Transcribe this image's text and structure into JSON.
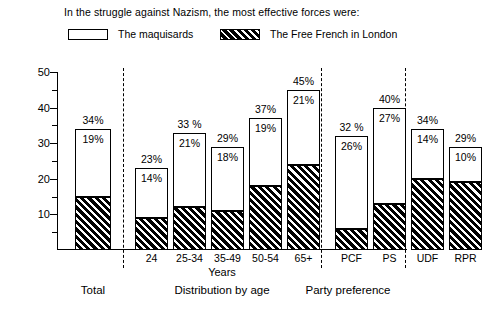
{
  "title": "In the struggle against Nazism, the most effective forces were:",
  "legend": [
    {
      "label": "The maquisards",
      "pattern": "white"
    },
    {
      "label": "The Free French in London",
      "pattern": "hatched"
    }
  ],
  "axes": {
    "ylabel": "Percent",
    "yticks": [
      "10",
      "20",
      "30",
      "40",
      "50"
    ],
    "ymin": 0,
    "ymax": 50,
    "xlabel_age": "Years"
  },
  "groups": [
    {
      "name": "Total",
      "title": "Total",
      "subtitle": ""
    },
    {
      "name": "age",
      "title": "Distribution by age",
      "subtitle": "Years"
    },
    {
      "name": "party",
      "title": "Party preference",
      "subtitle": ""
    }
  ],
  "chart_data": {
    "type": "bar",
    "title": "In the struggle against Nazism, the most effective forces were:",
    "xlabel": "",
    "ylabel": "Percent",
    "ylim": [
      0,
      50
    ],
    "grid": false,
    "legend_position": "top",
    "stacked": true,
    "groups": [
      "Total",
      "Distribution by age",
      "Party preference"
    ],
    "categories": [
      "Total",
      "24",
      "25-34",
      "35-49",
      "50-54",
      "65+",
      "PCF",
      "PS",
      "UDF",
      "RPR"
    ],
    "series": [
      {
        "name": "The maquisards",
        "pattern": "white",
        "values": [
          19,
          14,
          21,
          18,
          19,
          21,
          26,
          27,
          14,
          10
        ]
      },
      {
        "name": "The Free French in London",
        "pattern": "hatched",
        "values": [
          15,
          9,
          12,
          11,
          18,
          24,
          6,
          13,
          20,
          19
        ]
      }
    ],
    "totals": [
      34,
      23,
      33,
      29,
      37,
      45,
      32,
      40,
      34,
      29
    ],
    "top_labels": [
      "34%",
      "23%",
      "33 %",
      "29%",
      "37%",
      "45%",
      "32 %",
      "40%",
      "34%",
      "29%"
    ],
    "inner_labels": [
      "19%",
      "14%",
      "21%",
      "18%",
      "19%",
      "21%",
      "26%",
      "27%",
      "14%",
      "10%"
    ]
  },
  "bars": [
    {
      "cat": "Total",
      "total": 34,
      "white": 19,
      "hatch": 15,
      "top_label": "34%",
      "inner_label": "19%",
      "x": 18,
      "w": 36
    },
    {
      "cat": "24",
      "total": 23,
      "white": 14,
      "hatch": 9,
      "top_label": "23%",
      "inner_label": "14%",
      "x": 78,
      "w": 33
    },
    {
      "cat": "25-34",
      "total": 33,
      "white": 21,
      "hatch": 12,
      "top_label": "33 %",
      "inner_label": "21%",
      "x": 116,
      "w": 33
    },
    {
      "cat": "35-49",
      "total": 29,
      "white": 18,
      "hatch": 11,
      "top_label": "29%",
      "inner_label": "18%",
      "x": 154,
      "w": 33
    },
    {
      "cat": "50-54",
      "total": 37,
      "white": 19,
      "hatch": 18,
      "top_label": "37%",
      "inner_label": "19%",
      "x": 192,
      "w": 33
    },
    {
      "cat": "65+",
      "total": 45,
      "white": 21,
      "hatch": 24,
      "top_label": "45%",
      "inner_label": "21%",
      "x": 230,
      "w": 33
    },
    {
      "cat": "PCF",
      "total": 32,
      "white": 26,
      "hatch": 6,
      "top_label": "32 %",
      "inner_label": "26%",
      "x": 278,
      "w": 33
    },
    {
      "cat": "PS",
      "total": 40,
      "white": 27,
      "hatch": 13,
      "top_label": "40%",
      "inner_label": "27%",
      "x": 316,
      "w": 33
    },
    {
      "cat": "UDF",
      "total": 34,
      "white": 14,
      "hatch": 20,
      "top_label": "34%",
      "inner_label": "14%",
      "x": 354,
      "w": 33
    },
    {
      "cat": "RPR",
      "total": 29,
      "white": 10,
      "hatch": 19,
      "top_label": "29%",
      "inner_label": "10%",
      "x": 392,
      "w": 33
    }
  ],
  "group_titles": {
    "total": "Total",
    "age": "Distribution by age",
    "age_sub": "Years",
    "party": "Party preference"
  }
}
